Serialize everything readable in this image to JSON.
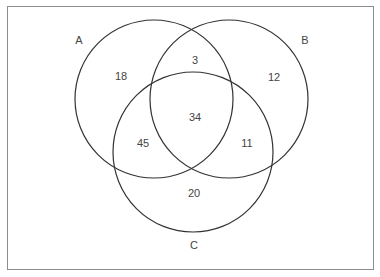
{
  "diagram": {
    "type": "venn",
    "sets": [
      {
        "label": "A",
        "cx": 154,
        "cy": 99,
        "r": 79
      },
      {
        "label": "B",
        "cx": 229,
        "cy": 99,
        "r": 79
      },
      {
        "label": "C",
        "cx": 193,
        "cy": 152,
        "r": 80
      }
    ],
    "set_labels": {
      "A": "A",
      "B": "B",
      "C": "C"
    },
    "regions": {
      "A_only": "18",
      "B_only": "12",
      "C_only": "20",
      "A_and_B_only": "3",
      "A_and_C_only": "45",
      "B_and_C_only": "11",
      "A_B_C": "34"
    },
    "stroke_color": "#333333",
    "border_color": "#8c8c8c"
  }
}
